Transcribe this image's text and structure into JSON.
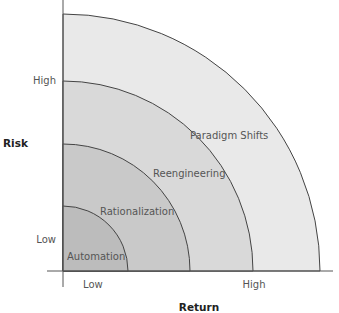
{
  "diagram": {
    "y_axis": {
      "title": "Risk",
      "ticks": [
        "High",
        "Low"
      ]
    },
    "x_axis": {
      "title": "Return",
      "ticks": [
        "Low",
        "High"
      ]
    },
    "zones": [
      {
        "label": "Paradigm Shifts",
        "color": "#e9e9e9"
      },
      {
        "label": "Reengineering",
        "color": "#d9d9d9"
      },
      {
        "label": "Rationalization",
        "color": "#c9c9c9"
      },
      {
        "label": "Automation",
        "color": "#bcbcbc"
      }
    ]
  }
}
